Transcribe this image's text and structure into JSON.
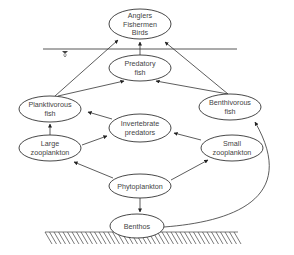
{
  "diagram": {
    "nodes": [
      {
        "id": "anglers",
        "lines": [
          "Anglers",
          "Fishermen",
          "Birds"
        ],
        "cx": 140,
        "cy": 24,
        "rx": 31,
        "ry": 15
      },
      {
        "id": "predatory_fish",
        "lines": [
          "Predatory",
          "fish"
        ],
        "cx": 140,
        "cy": 68,
        "rx": 31,
        "ry": 13
      },
      {
        "id": "planktivorous_fish",
        "lines": [
          "Planktivorous",
          "fish"
        ],
        "cx": 50,
        "cy": 109,
        "rx": 31,
        "ry": 13
      },
      {
        "id": "benthivorous_fish",
        "lines": [
          "Benthivorous",
          "fish"
        ],
        "cx": 230,
        "cy": 107,
        "rx": 31,
        "ry": 13
      },
      {
        "id": "invertebrate_predators",
        "lines": [
          "Invertebrate",
          "predators"
        ],
        "cx": 140,
        "cy": 128,
        "rx": 31,
        "ry": 14
      },
      {
        "id": "large_zooplankton",
        "lines": [
          "Large",
          "zooplankton"
        ],
        "cx": 50,
        "cy": 148,
        "rx": 31,
        "ry": 13
      },
      {
        "id": "small_zooplankton",
        "lines": [
          "Small",
          "zooplankton"
        ],
        "cx": 232,
        "cy": 148,
        "rx": 31,
        "ry": 13
      },
      {
        "id": "phytoplankton",
        "lines": [
          "Phytoplankton"
        ],
        "cx": 140,
        "cy": 186,
        "rx": 31,
        "ry": 12
      },
      {
        "id": "benthos",
        "lines": [
          "Benthos"
        ],
        "cx": 137,
        "cy": 226,
        "rx": 27,
        "ry": 12
      }
    ],
    "edges": [
      {
        "from": "predatory_fish",
        "to": "anglers",
        "d": "M140,55 L140,42",
        "arrow": [
          140,
          41
        ]
      },
      {
        "from": "planktivorous_fish",
        "to": "anglers",
        "d": "M55,96 L118,40",
        "arrow": [
          119,
          39
        ]
      },
      {
        "from": "benthivorous_fish",
        "to": "anglers",
        "d": "M228,94 L165,42",
        "arrow": [
          164,
          41
        ]
      },
      {
        "from": "planktivorous_fish",
        "to": "predatory_fish",
        "d": "M58,96 L124,81",
        "arrow": [
          125,
          81
        ]
      },
      {
        "from": "benthivorous_fish",
        "to": "predatory_fish",
        "d": "M228,94 L156,81",
        "arrow": [
          155,
          81
        ]
      },
      {
        "from": "invertebrate_predators",
        "to": "planktivorous_fish",
        "d": "M112,119 L88,112",
        "arrow": [
          87,
          112
        ]
      },
      {
        "from": "large_zooplankton",
        "to": "planktivorous_fish",
        "d": "M50,135 L50,124",
        "arrow": [
          50,
          123
        ]
      },
      {
        "from": "large_zooplankton",
        "to": "invertebrate_predators",
        "d": "M82,145 L107,136",
        "arrow": [
          108,
          135
        ]
      },
      {
        "from": "small_zooplankton",
        "to": "invertebrate_predators",
        "d": "M201,140 L174,133",
        "arrow": [
          173,
          133
        ]
      },
      {
        "from": "phytoplankton",
        "to": "large_zooplankton",
        "d": "M113,178 L74,162",
        "arrow": [
          73,
          161
        ]
      },
      {
        "from": "phytoplankton",
        "to": "small_zooplankton",
        "d": "M171,180 L208,160",
        "arrow": [
          209,
          159
        ]
      },
      {
        "from": "phytoplankton",
        "to": "benthos",
        "d": "M140,198 L140,212",
        "arrow": [
          140,
          213
        ]
      },
      {
        "from": "benthos",
        "to": "benthivorous_fish",
        "d": "M164,227 C230,222 300,200 255,122",
        "arrow": [
          256,
          121
        ]
      }
    ],
    "water_surface": {
      "y": 49,
      "x1": 43,
      "x2": 237,
      "symbol_x": 65
    },
    "sediment": {
      "y": 232,
      "x1": 45,
      "x2": 238,
      "hatch_depth": 12
    },
    "colors": {
      "line": "#333333",
      "text": "#444444",
      "background": "#ffffff"
    }
  }
}
